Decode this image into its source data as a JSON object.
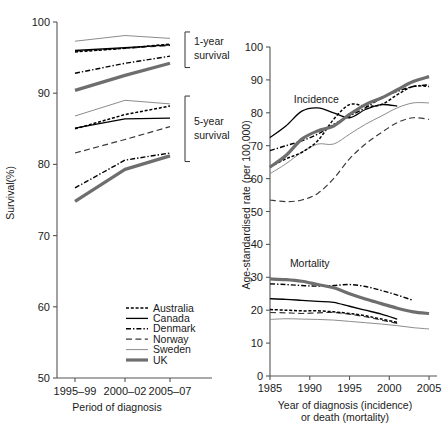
{
  "figure": {
    "panels": [
      "survival-panel",
      "rates-panel"
    ]
  },
  "legend": {
    "items": [
      {
        "label": "Australia",
        "style": "fine-dotted",
        "color": "#000000"
      },
      {
        "label": "Canada",
        "style": "solid",
        "color": "#000000"
      },
      {
        "label": "Denmark",
        "style": "dash-dot",
        "color": "#000000"
      },
      {
        "label": "Norway",
        "style": "long-dash",
        "color": "#3a3a3a"
      },
      {
        "label": "Sweden",
        "style": "thin-solid",
        "color": "#8c8c8c"
      },
      {
        "label": "UK",
        "style": "thick-solid",
        "color": "#6e6e6e"
      }
    ]
  },
  "chart_data": [
    {
      "type": "line",
      "name": "survival-panel",
      "title": "",
      "xlabel": "Period of diagnosis",
      "ylabel": "Survival(%)",
      "categories": [
        "1995–99",
        "2000–02",
        "2005–07"
      ],
      "ylim": [
        50,
        100
      ],
      "yticks": [
        50,
        60,
        70,
        80,
        90,
        100
      ],
      "grid": false,
      "legend_position": "bottom-right",
      "annotations": [
        {
          "text": "1-year survival",
          "group": "one-year"
        },
        {
          "text": "5-year survival",
          "group": "five-year"
        }
      ],
      "groups": [
        {
          "name": "1-year survival",
          "series": [
            {
              "name": "Australia",
              "values": [
                95.8,
                96.3,
                96.9
              ]
            },
            {
              "name": "Canada",
              "values": [
                96.0,
                96.4,
                96.8
              ]
            },
            {
              "name": "Denmark",
              "values": [
                92.8,
                94.2,
                95.2
              ]
            },
            {
              "name": "Norway",
              "values": [
                95.9,
                96.3,
                96.7
              ]
            },
            {
              "name": "Sweden",
              "values": [
                97.3,
                98.1,
                97.7
              ]
            },
            {
              "name": "UK",
              "values": [
                90.4,
                92.5,
                94.2
              ]
            }
          ]
        },
        {
          "name": "5-year survival",
          "series": [
            {
              "name": "Australia",
              "values": [
                85.0,
                87.0,
                88.2
              ]
            },
            {
              "name": "Canada",
              "values": [
                85.1,
                86.4,
                86.5
              ]
            },
            {
              "name": "Denmark",
              "values": [
                76.7,
                80.6,
                81.6
              ]
            },
            {
              "name": "Norway",
              "values": [
                81.6,
                83.5,
                85.3
              ]
            },
            {
              "name": "Sweden",
              "values": [
                86.8,
                89.0,
                88.5
              ]
            },
            {
              "name": "UK",
              "values": [
                74.8,
                79.3,
                81.2
              ]
            }
          ]
        }
      ]
    },
    {
      "type": "line",
      "name": "rates-panel",
      "title": "",
      "xlabel": "Year of diagnosis (incidence) or death (mortality)",
      "xlabel_line1": "Year of diagnosis (incidence)",
      "xlabel_line2": "or death (mortality)",
      "ylabel": "Age-standardised rate (per 100,000)",
      "ylim": [
        0,
        100
      ],
      "yticks": [
        0,
        10,
        20,
        30,
        40,
        50,
        60,
        70,
        80,
        90,
        100
      ],
      "xlim": [
        1985,
        2006
      ],
      "xticks": [
        1985,
        1990,
        1995,
        2000,
        2005
      ],
      "grid": false,
      "annotations": [
        {
          "text": "Incidence",
          "x": 1988,
          "y": 83
        },
        {
          "text": "Mortality",
          "x": 1987.5,
          "y": 33
        }
      ],
      "groups": [
        {
          "name": "Incidence",
          "x": [
            1985,
            1987,
            1989,
            1991,
            1993,
            1995,
            1997,
            1999,
            2001,
            2003,
            2005
          ],
          "series": [
            {
              "name": "Australia",
              "values": [
                63.5,
                66.0,
                68.0,
                71.5,
                78.0,
                82.5,
                82.0,
                82.5,
                85.5,
                88.0,
                88.0
              ]
            },
            {
              "name": "Canada",
              "values": [
                72.5,
                76.0,
                80.5,
                81.5,
                80.0,
                78.5,
                81.0,
                82.5,
                82.0,
                null,
                null
              ]
            },
            {
              "name": "Denmark",
              "values": [
                68.5,
                70.0,
                71.5,
                73.5,
                76.5,
                79.0,
                81.5,
                84.5,
                86.5,
                88.0,
                88.5
              ]
            },
            {
              "name": "Norway",
              "values": [
                53.5,
                53.0,
                53.5,
                55.5,
                60.0,
                66.0,
                70.5,
                74.0,
                77.0,
                78.5,
                78.0
              ]
            },
            {
              "name": "Sweden",
              "values": [
                61.5,
                64.5,
                68.0,
                70.5,
                70.5,
                73.5,
                76.5,
                79.0,
                81.5,
                83.0,
                83.0
              ]
            },
            {
              "name": "UK",
              "values": [
                63.5,
                67.0,
                72.0,
                74.5,
                76.0,
                79.5,
                82.5,
                84.5,
                87.0,
                89.5,
                91.0
              ]
            }
          ]
        },
        {
          "name": "Mortality",
          "x": [
            1985,
            1987,
            1989,
            1991,
            1993,
            1995,
            1997,
            1999,
            2001,
            2003,
            2005
          ],
          "series": [
            {
              "name": "Australia",
              "values": [
                20.2,
                20.0,
                19.8,
                19.8,
                19.5,
                19.0,
                18.3,
                17.3,
                16.3,
                null,
                null
              ]
            },
            {
              "name": "Canada",
              "values": [
                23.5,
                23.3,
                23.0,
                22.7,
                22.4,
                21.2,
                20.0,
                18.8,
                17.3,
                null,
                null
              ]
            },
            {
              "name": "Denmark",
              "values": [
                28.0,
                27.8,
                27.5,
                27.3,
                27.5,
                27.8,
                27.2,
                26.0,
                24.6,
                23.0,
                null
              ]
            },
            {
              "name": "Norway",
              "values": [
                19.3,
                19.2,
                19.0,
                19.2,
                19.3,
                18.8,
                18.0,
                17.0,
                16.0,
                null,
                null
              ]
            },
            {
              "name": "Sweden",
              "values": [
                17.2,
                17.4,
                17.3,
                17.2,
                17.0,
                16.6,
                16.2,
                15.8,
                15.3,
                14.7,
                14.3
              ]
            },
            {
              "name": "UK",
              "values": [
                29.5,
                29.3,
                28.8,
                27.8,
                26.8,
                25.0,
                23.4,
                22.0,
                20.6,
                19.5,
                19.0
              ]
            }
          ]
        }
      ]
    }
  ]
}
